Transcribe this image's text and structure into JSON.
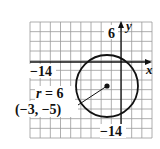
{
  "chart_data": {
    "type": "scatter",
    "title": "",
    "xlabel": "x",
    "ylabel": "y",
    "xlim": [
      -18,
      6
    ],
    "ylim": [
      -16,
      8
    ],
    "grid": true,
    "grid_step": 2,
    "tick_labels": {
      "x": [
        {
          "value": -14,
          "label": "−14"
        }
      ],
      "y": [
        {
          "value": 6,
          "label": "6"
        },
        {
          "value": -14,
          "label": "−14"
        }
      ]
    },
    "circle": {
      "center": [
        -3,
        -5
      ],
      "radius": 6
    },
    "points": [
      {
        "x": -3,
        "y": -5,
        "label": "(−3, −5)"
      }
    ],
    "annotations": [
      {
        "text": "r = 6",
        "type": "radius-label"
      },
      {
        "text": "(−3, −5)",
        "type": "center-label"
      }
    ]
  },
  "labels": {
    "x_axis": "x",
    "y_axis": "y",
    "x_tick_neg14": "−14",
    "y_tick_6": "6",
    "y_tick_neg14": "−14",
    "radius_r": "r",
    "radius_eq": " = 6",
    "center": "(−3, −5)"
  },
  "colors": {
    "grid": "#9a9a9a",
    "axis": "#111111",
    "circle": "#111111",
    "background": "#ffffff"
  }
}
